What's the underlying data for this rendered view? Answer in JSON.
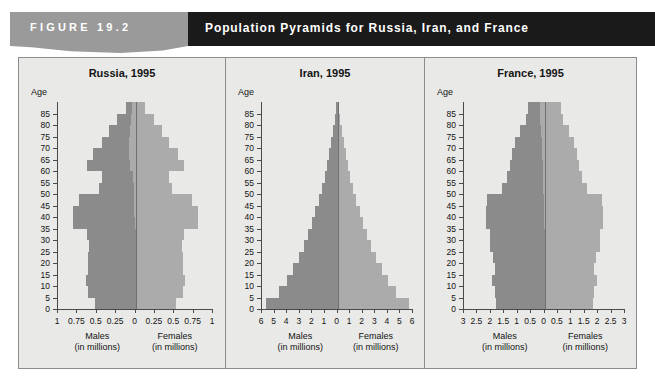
{
  "header": {
    "figure_label": "FIGURE  19.2",
    "title": "Population Pyramids for Russia, Iran, and France",
    "band_color": "#1a1a1a",
    "tab_color": "#9a9a9a"
  },
  "legend": {
    "males_label": "Males",
    "females_label": "Females",
    "units_label": "(in millions)",
    "age_axis_label": "Age",
    "male_color": "#8b8b8b",
    "female_color": "#ababab"
  },
  "chart_data": [
    {
      "type": "bar",
      "title": "Russia, 1995",
      "xlabel": "Males / Females (in millions)",
      "ylabel": "Age",
      "orientation": "population-pyramid",
      "xlim": [
        -1,
        1
      ],
      "xticks": [
        1,
        0.75,
        0.5,
        0.25,
        0,
        0.25,
        0.5,
        0.75,
        1
      ],
      "xtick_labels": [
        "1",
        "0.75",
        "0.5",
        "0.25",
        "0",
        "0.25",
        "0.5",
        "0.75",
        "1"
      ],
      "categories": [
        "0",
        "5",
        "10",
        "15",
        "20",
        "25",
        "30",
        "35",
        "40",
        "45",
        "50",
        "55",
        "60",
        "65",
        "70",
        "75",
        "80",
        "85"
      ],
      "ytick_labels": [
        "0",
        "5",
        "10",
        "15",
        "20",
        "25",
        "30",
        "35",
        "40",
        "45",
        "50",
        "55",
        "60",
        "65",
        "70",
        "75",
        "80",
        "85"
      ],
      "series": [
        {
          "name": "Males",
          "values": [
            0.53,
            0.62,
            0.65,
            0.62,
            0.62,
            0.6,
            0.63,
            0.8,
            0.79,
            0.71,
            0.45,
            0.4,
            0.55,
            0.47,
            0.35,
            0.27,
            0.18,
            0.08
          ]
        },
        {
          "name": "Females",
          "values": [
            0.51,
            0.6,
            0.63,
            0.6,
            0.61,
            0.6,
            0.63,
            0.81,
            0.82,
            0.76,
            0.5,
            0.47,
            0.7,
            0.63,
            0.52,
            0.42,
            0.3,
            0.17
          ]
        }
      ],
      "grid": false,
      "legend_position": "below-axis"
    },
    {
      "type": "bar",
      "title": "Iran, 1995",
      "xlabel": "Males / Females (in millions)",
      "ylabel": "Age",
      "orientation": "population-pyramid",
      "xlim": [
        -6,
        6
      ],
      "xticks": [
        6,
        5,
        4,
        3,
        2,
        1,
        0,
        1,
        2,
        3,
        4,
        5,
        6
      ],
      "xtick_labels": [
        "6",
        "5",
        "4",
        "3",
        "2",
        "1",
        "0",
        "1",
        "2",
        "3",
        "4",
        "5",
        "6"
      ],
      "categories": [
        "0",
        "5",
        "10",
        "15",
        "20",
        "25",
        "30",
        "35",
        "40",
        "45",
        "50",
        "55",
        "60",
        "65",
        "70",
        "75",
        "80",
        "85"
      ],
      "ytick_labels": [
        "0",
        "5",
        "10",
        "15",
        "20",
        "25",
        "30",
        "35",
        "40",
        "45",
        "50",
        "55",
        "60",
        "65",
        "70",
        "75",
        "80",
        "85"
      ],
      "series": [
        {
          "name": "Males",
          "values": [
            5.8,
            4.7,
            4.1,
            3.6,
            3.1,
            2.7,
            2.4,
            2.1,
            1.8,
            1.5,
            1.2,
            1.0,
            0.85,
            0.65,
            0.5,
            0.35,
            0.22,
            0.12
          ]
        },
        {
          "name": "Females",
          "values": [
            5.6,
            4.6,
            4.0,
            3.5,
            3.0,
            2.6,
            2.3,
            2.0,
            1.75,
            1.45,
            1.2,
            1.0,
            0.85,
            0.65,
            0.5,
            0.35,
            0.22,
            0.12
          ]
        }
      ],
      "grid": false,
      "legend_position": "below-axis"
    },
    {
      "type": "bar",
      "title": "France, 1995",
      "xlabel": "Males / Females (in millions)",
      "ylabel": "Age",
      "orientation": "population-pyramid",
      "xlim": [
        -3,
        3
      ],
      "xticks": [
        3,
        2.5,
        2,
        1.5,
        1,
        0.5,
        0,
        0.5,
        1,
        1.5,
        2,
        2.5,
        3
      ],
      "xtick_labels": [
        "3",
        "2.5",
        "2",
        "1.5",
        "1",
        "0.5",
        "0",
        "0.5",
        "1",
        "1.5",
        "2",
        "2.5",
        "3"
      ],
      "categories": [
        "0",
        "5",
        "10",
        "15",
        "20",
        "25",
        "30",
        "35",
        "40",
        "45",
        "50",
        "55",
        "60",
        "65",
        "70",
        "75",
        "80",
        "85"
      ],
      "ytick_labels": [
        "0",
        "5",
        "10",
        "15",
        "20",
        "25",
        "30",
        "35",
        "40",
        "45",
        "50",
        "55",
        "60",
        "65",
        "70",
        "75",
        "80",
        "85"
      ],
      "series": [
        {
          "name": "Males",
          "values": [
            1.85,
            1.9,
            2.0,
            1.9,
            1.95,
            2.1,
            2.05,
            2.15,
            2.15,
            2.1,
            1.55,
            1.35,
            1.25,
            1.15,
            1.0,
            0.8,
            0.55,
            0.45
          ]
        },
        {
          "name": "Females",
          "values": [
            1.78,
            1.82,
            1.9,
            1.82,
            1.88,
            2.0,
            2.05,
            2.2,
            2.2,
            2.15,
            1.65,
            1.45,
            1.35,
            1.3,
            1.2,
            1.05,
            0.85,
            0.8
          ]
        }
      ],
      "grid": false,
      "legend_position": "below-axis"
    }
  ]
}
